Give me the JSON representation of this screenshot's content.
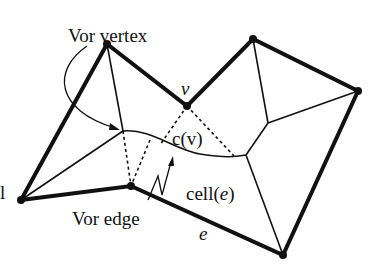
{
  "figure": {
    "labels": {
      "vor_vertex": "Vor vertex",
      "v": "v",
      "c_v": "c(v)",
      "cell_prefix": "cell(",
      "cell_e": "e",
      "cell_suffix": ")",
      "vor_edge": "Vor edge",
      "e": "e",
      "cut_char": "l"
    },
    "colors": {
      "ink": "#111111",
      "background": "#ffffff"
    },
    "polygon_vertices": [
      {
        "id": "p_left",
        "x": 21,
        "y": 200
      },
      {
        "id": "p_top_left",
        "x": 107,
        "y": 44
      },
      {
        "id": "p_v",
        "x": 187,
        "y": 106
      },
      {
        "id": "p_top_right",
        "x": 253,
        "y": 39
      },
      {
        "id": "p_right",
        "x": 358,
        "y": 91
      },
      {
        "id": "p_bottom_right",
        "x": 283,
        "y": 255
      },
      {
        "id": "p_mid_bottom",
        "x": 131,
        "y": 186
      }
    ]
  }
}
